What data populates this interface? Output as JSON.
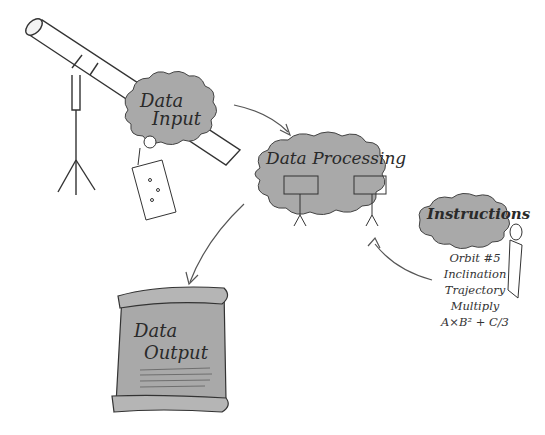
{
  "diagram": {
    "nodes": [
      {
        "id": "input",
        "label_line1": "Data",
        "label_line2": "Input",
        "shape": "cloud"
      },
      {
        "id": "processing",
        "label": "Data Processing",
        "shape": "cloud"
      },
      {
        "id": "instructions",
        "label": "Instructions",
        "shape": "cloud"
      },
      {
        "id": "output",
        "label_line1": "Data",
        "label_line2": "Output",
        "shape": "scroll"
      }
    ],
    "instructions_list": [
      "Orbit #5",
      "Inclination",
      "Trajectory",
      "Multiply",
      "A×B² + C/3"
    ],
    "edges": [
      {
        "from": "input",
        "to": "processing"
      },
      {
        "from": "instructions",
        "to": "processing"
      },
      {
        "from": "processing",
        "to": "output"
      }
    ],
    "decorations": [
      "telescope",
      "stick-figure-observer",
      "data-map-scroll",
      "stick-figures-at-blackboards",
      "stick-figure-instructor"
    ]
  },
  "colors": {
    "cloud_fill": "#a9a9a9",
    "outline": "#333333",
    "background": "#ffffff"
  }
}
